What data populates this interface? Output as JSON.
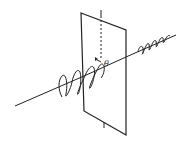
{
  "diagram": {
    "labels": {
      "angle": "θ"
    },
    "colors": {
      "stroke": "#222222",
      "background": "#ffffff"
    }
  }
}
